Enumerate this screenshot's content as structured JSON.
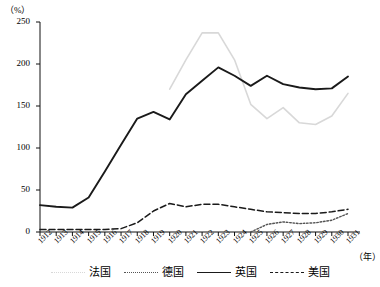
{
  "chart_data": {
    "type": "line",
    "title": "",
    "xlabel": "（年）",
    "ylabel": "（%）",
    "ylim": [
      0,
      250
    ],
    "yticks": [
      0,
      50,
      100,
      150,
      200,
      250
    ],
    "grid": false,
    "legend_position": "bottom",
    "x": [
      1912,
      1913,
      1914,
      1915,
      1916,
      1917,
      1918,
      1919,
      1920,
      1921,
      1922,
      1923,
      1924,
      1925,
      1926,
      1927,
      1928,
      1929,
      1930,
      1931
    ],
    "xtick_labels": [
      "1912",
      "1913",
      "1914",
      "1915",
      "1916",
      "1917",
      "1918",
      "1919",
      "1920",
      "1921",
      "1922",
      "1923",
      "1924",
      "1925",
      "1926",
      "1927",
      "1928",
      "1929",
      "1930",
      "1931"
    ],
    "series": [
      {
        "name": "法国",
        "style": "dotted",
        "color": "#d8d8d8",
        "start_index": 8,
        "values": [
          null,
          null,
          null,
          null,
          null,
          null,
          null,
          null,
          170,
          205,
          237,
          237,
          205,
          152,
          135,
          148,
          130,
          128,
          138,
          165
        ]
      },
      {
        "name": "德国",
        "style": "fine-dotted",
        "color": "#555555",
        "start_index": 13,
        "values": [
          null,
          null,
          null,
          null,
          null,
          null,
          null,
          null,
          null,
          null,
          null,
          null,
          null,
          0,
          9,
          12,
          10,
          11,
          14,
          22
        ]
      },
      {
        "name": "英国",
        "style": "solid",
        "color": "#1a1a1a",
        "start_index": 0,
        "values": [
          32,
          30,
          29,
          41,
          72,
          104,
          135,
          143,
          134,
          164,
          180,
          196,
          186,
          174,
          186,
          176,
          172,
          170,
          171,
          185
        ]
      },
      {
        "name": "美国",
        "style": "dashed",
        "color": "#1a1a1a",
        "start_index": 0,
        "values": [
          3,
          3,
          3,
          3,
          3,
          4,
          11,
          25,
          34,
          30,
          33,
          33,
          30,
          27,
          24,
          23,
          22,
          22,
          24,
          27
        ]
      }
    ]
  },
  "legend": {
    "items": [
      {
        "label": "法国"
      },
      {
        "label": "德国"
      },
      {
        "label": "英国"
      },
      {
        "label": "美国"
      }
    ]
  }
}
